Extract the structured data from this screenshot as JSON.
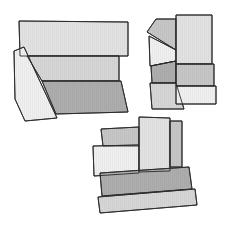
{
  "diagram": {
    "type": "polygon-puzzle-arrangements",
    "background": "#ffffff",
    "outline_color": "#2b2b2b",
    "hatch": "vertical-lines",
    "shades": {
      "very_light": "#f0f0f0",
      "light": "#e2e2e2",
      "light_medium": "#d6d6d6",
      "medium": "#c6c6c6",
      "dark": "#adadad"
    },
    "groups": [
      {
        "id": "group-1",
        "position": "top-left",
        "pieces": [
          {
            "name": "top-rectangle",
            "shade": "light",
            "points": "19,21 128,22 128,56 20,56"
          },
          {
            "name": "middle-band",
            "shade": "light_medium",
            "points": "27,56 119,56 119,81 42,81"
          },
          {
            "name": "bottom-trapezoid",
            "shade": "dark",
            "points": "42,81 121,81 128,112 56,114"
          },
          {
            "name": "left-slanted-piece",
            "shade": "very_light",
            "points": "14,51 24,47 57,118 25,121 15,99"
          }
        ]
      },
      {
        "id": "group-2",
        "position": "top-right",
        "pieces": [
          {
            "name": "top-left-pentagon",
            "shade": "medium",
            "points": "147,32 156,19 176,19 176,50"
          },
          {
            "name": "left-middle-piece",
            "shade": "very_light",
            "points": "149,36 176,50 176,61 150,66"
          },
          {
            "name": "left-lower-piece",
            "shade": "dark",
            "points": "151,66 176,61 176,83 152,83"
          },
          {
            "name": "left-bottom-piece",
            "shade": "light_medium",
            "points": "150,83 176,83 184,109 152,109"
          },
          {
            "name": "right-tall-rectangle",
            "shade": "light",
            "points": "176,15 212,15 212,64 176,64"
          },
          {
            "name": "right-middle-band",
            "shade": "medium",
            "points": "176,64 214,64 214,86 176,86"
          },
          {
            "name": "right-bottom-band",
            "shade": "very_light",
            "points": "176,86 216,86 216,104 176,104"
          }
        ]
      },
      {
        "id": "group-3",
        "position": "bottom-center",
        "pieces": [
          {
            "name": "top-left-rectangle",
            "shade": "medium",
            "points": "101,129 139,127 139,146 103,146"
          },
          {
            "name": "left-light-rectangle",
            "shade": "very_light",
            "points": "93,146 139,145 139,173 94,176"
          },
          {
            "name": "tall-center-rectangle",
            "shade": "light",
            "points": "139,117 170,118 170,171 139,172"
          },
          {
            "name": "right-narrow-rectangle",
            "shade": "medium",
            "points": "170,121 182,121 182,167 170,167"
          },
          {
            "name": "upper-base-band",
            "shade": "dark",
            "points": "100,173 189,167 192,189 102,196"
          },
          {
            "name": "lower-base-band",
            "shade": "light_medium",
            "points": "98,197 195,189 197,205 100,213"
          }
        ]
      }
    ]
  }
}
